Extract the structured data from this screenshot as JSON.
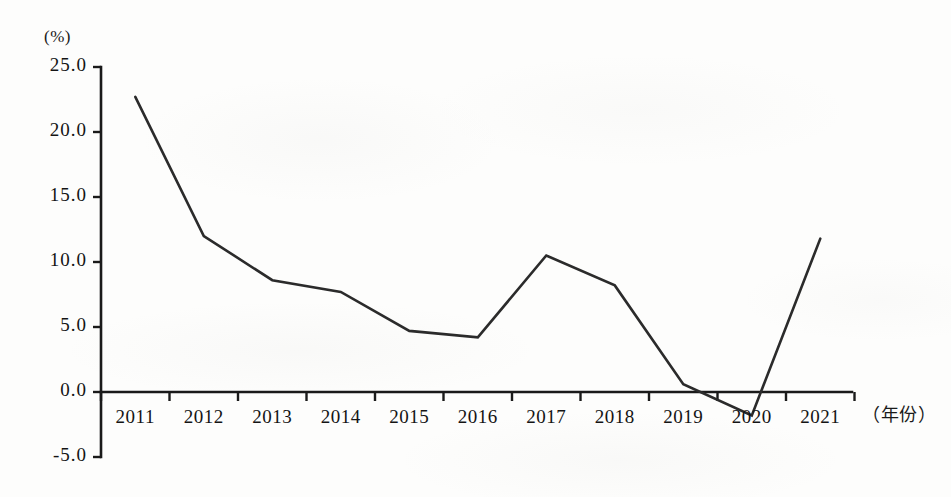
{
  "chart_data": {
    "type": "line",
    "title": "",
    "xlabel": "（年份）",
    "ylabel": "(%)",
    "categories": [
      "2011",
      "2012",
      "2013",
      "2014",
      "2015",
      "2016",
      "2017",
      "2018",
      "2019",
      "2020",
      "2021"
    ],
    "values": [
      22.7,
      12.0,
      8.6,
      7.7,
      4.7,
      4.2,
      10.5,
      8.2,
      0.6,
      -1.8,
      11.8
    ],
    "series": [
      {
        "name": "",
        "values": [
          22.7,
          12.0,
          8.6,
          7.7,
          4.7,
          4.2,
          10.5,
          8.2,
          0.6,
          -1.8,
          11.8
        ]
      }
    ],
    "ylim": [
      -5.0,
      25.0
    ],
    "ytick_labels": [
      "25.0",
      "20.0",
      "15.0",
      "10.0",
      "5.0",
      "0.0",
      "-5.0"
    ],
    "ytick_values": [
      25.0,
      20.0,
      15.0,
      10.0,
      5.0,
      0.0,
      -5.0
    ],
    "grid": false,
    "legend": "none",
    "line_color": "#2b2b2b",
    "axis_color": "#1a1a1a",
    "background_color": "#fdfdfc"
  }
}
